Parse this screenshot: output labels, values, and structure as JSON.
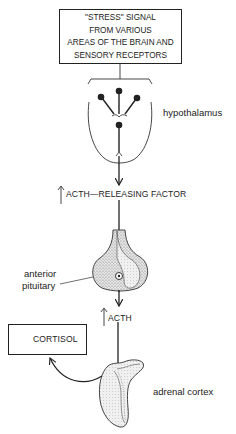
{
  "diagram": {
    "title_box": {
      "lines": [
        "\"STRESS\" SIGNAL",
        "FROM VARIOUS",
        "AREAS OF THE BRAIN AND",
        "SENSORY RECEPTORS"
      ]
    },
    "labels": {
      "hypothalamus": "hypothalamus",
      "acth_releasing_factor": "ACTH—RELEASING FACTOR",
      "anterior_pituitary_line1": "anterior",
      "anterior_pituitary_line2": "pituitary",
      "acth": "ACTH",
      "cortisol": "CORTISOL",
      "adrenal_cortex": "adrenal cortex"
    },
    "flow": [
      {
        "from": "\"STRESS\" SIGNAL",
        "to": "hypothalamus"
      },
      {
        "from": "hypothalamus",
        "to": "anterior pituitary",
        "via": "↑ ACTH—RELEASING FACTOR"
      },
      {
        "from": "anterior pituitary",
        "to": "adrenal cortex",
        "via": "↑ ACTH"
      },
      {
        "from": "adrenal cortex",
        "to": "↑ CORTISOL"
      }
    ],
    "colors": {
      "ink": "#222222",
      "background": "#ffffff",
      "stipple": "#9a9a9a"
    }
  }
}
